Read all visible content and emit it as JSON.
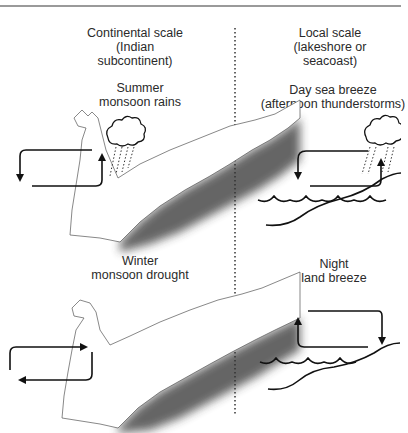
{
  "figure": {
    "left_column": {
      "heading": "Continental scale\n(Indian\nsubcontinent)",
      "panels": [
        {
          "id": "summer",
          "title": "Summer\nmonsoon rains",
          "flow": "onshore",
          "weather": "rain-cloud"
        },
        {
          "id": "winter",
          "title": "Winter\nmonsoon drought",
          "flow": "offshore",
          "weather": "none"
        }
      ]
    },
    "right_column": {
      "heading": "Local scale\n(lakeshore or\nseacoast)",
      "panels": [
        {
          "id": "day",
          "title": "Day sea breeze\n(afternoon thunderstorms)",
          "flow": "onshore",
          "weather": "rain-cloud"
        },
        {
          "id": "night",
          "title": "Night\nland breeze",
          "flow": "offshore",
          "weather": "none"
        }
      ]
    },
    "divider": "dotted-vertical",
    "colors": {
      "ink": "#111111",
      "text": "#2a2a2a",
      "rule": "#9a9a9a",
      "shadow": "#3a3a3a"
    }
  }
}
